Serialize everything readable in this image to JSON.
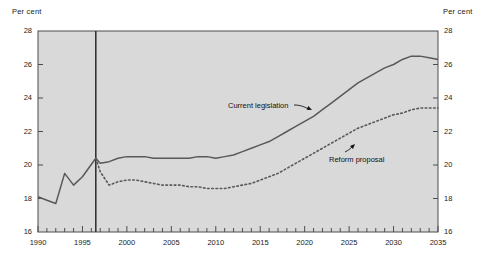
{
  "figure": {
    "y_axis_title_left": "Per cent",
    "y_axis_title_right": "Per cent",
    "background_color": "#d9d9d9",
    "line_color": "#595959",
    "frame_color": "#4d4d4d"
  },
  "annotations": {
    "current_legislation": "Current legislation",
    "reform_proposal": "Reform proposal"
  },
  "yticks": [
    "16",
    "18",
    "20",
    "22",
    "24",
    "26",
    "28"
  ],
  "xticks": [
    "1990",
    "1995",
    "2000",
    "2005",
    "2010",
    "2015",
    "2020",
    "2025",
    "2030",
    "2035"
  ],
  "chart_data": {
    "type": "line",
    "title": "",
    "xlabel": "",
    "ylabel": "Per cent",
    "xlim": [
      1990,
      2035
    ],
    "ylim": [
      16,
      28
    ],
    "ytick_step": 2,
    "xtick_step_minor": 1,
    "xtick_step_major": 5,
    "grid": false,
    "legend": "inline-annotations",
    "divider_x": 1996.5,
    "divider_label": "history / projection boundary",
    "series": [
      {
        "name": "Current legislation",
        "style": "solid",
        "x": [
          1990,
          1991,
          1992,
          1993,
          1994,
          1995,
          1996.5,
          1997,
          1998,
          1999,
          2000,
          2001,
          2002,
          2003,
          2004,
          2005,
          2006,
          2007,
          2008,
          2009,
          2010,
          2011,
          2012,
          2013,
          2014,
          2015,
          2016,
          2017,
          2018,
          2019,
          2020,
          2021,
          2022,
          2023,
          2024,
          2025,
          2026,
          2027,
          2028,
          2029,
          2030,
          2031,
          2032,
          2033,
          2034,
          2035
        ],
        "values": [
          18.1,
          17.9,
          17.7,
          19.5,
          18.8,
          19.3,
          20.4,
          20.1,
          20.2,
          20.4,
          20.5,
          20.5,
          20.5,
          20.4,
          20.4,
          20.4,
          20.4,
          20.4,
          20.5,
          20.5,
          20.4,
          20.5,
          20.6,
          20.8,
          21.0,
          21.2,
          21.4,
          21.7,
          22.0,
          22.3,
          22.6,
          22.9,
          23.3,
          23.7,
          24.1,
          24.5,
          24.9,
          25.2,
          25.5,
          25.8,
          26.0,
          26.3,
          26.5,
          26.5,
          26.4,
          26.3
        ]
      },
      {
        "name": "Reform proposal",
        "style": "dotted",
        "x": [
          1996.5,
          1997,
          1998,
          1999,
          2000,
          2001,
          2002,
          2003,
          2004,
          2005,
          2006,
          2007,
          2008,
          2009,
          2010,
          2011,
          2012,
          2013,
          2014,
          2015,
          2016,
          2017,
          2018,
          2019,
          2020,
          2021,
          2022,
          2023,
          2024,
          2025,
          2026,
          2027,
          2028,
          2029,
          2030,
          2031,
          2032,
          2033,
          2034,
          2035
        ],
        "values": [
          20.4,
          19.6,
          18.8,
          19.0,
          19.1,
          19.1,
          19.0,
          18.9,
          18.8,
          18.8,
          18.8,
          18.7,
          18.7,
          18.6,
          18.6,
          18.6,
          18.7,
          18.8,
          18.9,
          19.1,
          19.3,
          19.5,
          19.8,
          20.1,
          20.4,
          20.7,
          21.0,
          21.3,
          21.6,
          21.9,
          22.2,
          22.4,
          22.6,
          22.8,
          23.0,
          23.1,
          23.3,
          23.4,
          23.4,
          23.4
        ]
      }
    ]
  }
}
